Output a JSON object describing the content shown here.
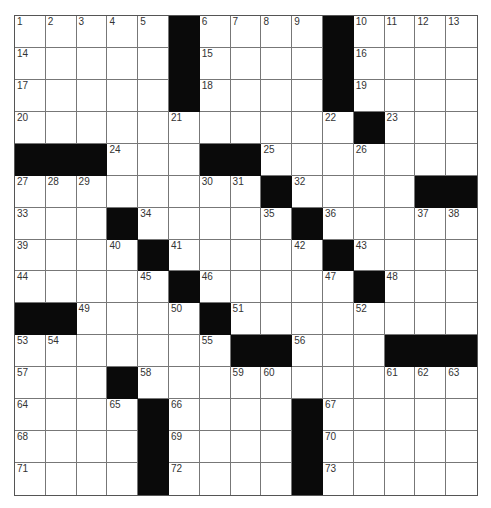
{
  "puzzle": {
    "rows": 15,
    "cols": 15,
    "layout": [
      "1,2,3,4,5,#,6,7,8,9,#,10,11,12,13",
      "14,.,.,.,.,#,15,.,.,.,#,16,.,.,.",
      "17,.,.,.,.,#,18,.,.,.,#,19,.,.,.",
      "20,.,.,.,.,21,.,.,.,.,22,#,23,.,.",
      "#,#,#,24,.,.,#,#,25,.,.,26,.,.,.",
      "27,28,29,.,.,.,30,31,#,32,.,.,.,#,#",
      "33,.,.,#,34,.,.,.,35,#,36,.,.,37,38",
      "39,.,.,40,#,41,.,.,.,42,#,43,.,.,.",
      "44,.,.,.,45,#,46,.,.,.,47,#,48,.,.",
      "#,#,49,.,.,50,#,51,.,.,.,52,.,.,.",
      "53,54,.,.,.,.,55,#,#,56,.,.,#,#,#",
      "57,.,.,#,58,.,.,59,60,.,.,.,61,62,63",
      "64,.,.,65,#,66,.,.,.,#,67,.,.,.,.",
      "68,.,.,.,#,69,.,.,.,#,70,.,.,.,.",
      "71,.,.,.,#,72,.,.,.,#,73,.,.,.,."
    ],
    "colors": {
      "block": "#0a0a0a",
      "cell": "#ffffff",
      "gridline": "#777777",
      "number": "#333333"
    }
  }
}
